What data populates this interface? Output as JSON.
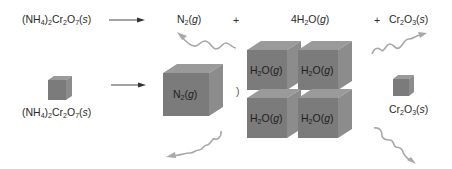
{
  "equation": {
    "reactant": {
      "base": "(NH",
      "sub1": "4",
      "mid1": ")",
      "sub2": "2",
      "mid2": "Cr",
      "sub3": "2",
      "mid3": "O",
      "sub4": "7",
      "state": "s"
    },
    "plus1": "+",
    "plus2": "+",
    "product1": {
      "base": "N",
      "sub": "2",
      "state": "g"
    },
    "product2": {
      "coef": "4",
      "base": "H",
      "sub": "2",
      "tail": "O",
      "state": "g"
    },
    "product3": {
      "base": "Cr",
      "sub1": "2",
      "mid": "O",
      "sub2": "3",
      "state": "s"
    }
  },
  "particles": {
    "reactant_label": {
      "base": "(NH",
      "sub1": "4",
      "mid1": ")",
      "sub2": "2",
      "mid2": "Cr",
      "sub3": "2",
      "mid3": "O",
      "sub4": "7",
      "state": "s"
    },
    "n2_cube": {
      "base": "N",
      "sub": "2",
      "state": "g"
    },
    "paren": ")",
    "h2o_cubes": [
      {
        "base": "H",
        "sub": "2",
        "tail": "O",
        "state": "g"
      },
      {
        "base": "H",
        "sub": "2",
        "tail": "O",
        "state": "g"
      },
      {
        "base": "H",
        "sub": "2",
        "tail": "O",
        "state": "g"
      },
      {
        "base": "H",
        "sub": "2",
        "tail": "O",
        "state": "g"
      }
    ],
    "cr2o3_label": {
      "base": "Cr",
      "sub1": "2",
      "mid": "O",
      "sub2": "3",
      "state": "s"
    }
  },
  "colors": {
    "cube_front": "#7b7b7b",
    "cube_top": "#9a9a9a",
    "cube_side": "#8c8c8c",
    "arrow": "#333333",
    "squiggle": "#a8a8a8"
  }
}
